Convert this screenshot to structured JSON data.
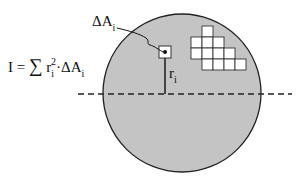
{
  "diagram": {
    "formula": {
      "lhs": "I",
      "equals": "=",
      "sigma": "∑",
      "r": "r",
      "r_sub": "i",
      "r_sup": "2",
      "dot": "·",
      "delta_a": "ΔA",
      "delta_a_sub": "i"
    },
    "element_label": {
      "main": "ΔA",
      "sub": "i"
    },
    "radius_label": {
      "main": "r",
      "sub": "i"
    },
    "shape": {
      "type": "circle",
      "fill": "#c4c4c4",
      "stroke": "#222222",
      "center": [
        182,
        93
      ],
      "radius": 79
    },
    "axis": {
      "style": "dashed",
      "y": 94,
      "x_start": 78,
      "x_end": 292
    },
    "grid_cells": [
      [
        202,
        26
      ],
      [
        191,
        37
      ],
      [
        202,
        37
      ],
      [
        213,
        37
      ],
      [
        191,
        48
      ],
      [
        202,
        48
      ],
      [
        213,
        48
      ],
      [
        224,
        48
      ],
      [
        202,
        59
      ],
      [
        213,
        59
      ],
      [
        224,
        59
      ],
      [
        235,
        59
      ]
    ],
    "cell_size": 11
  }
}
